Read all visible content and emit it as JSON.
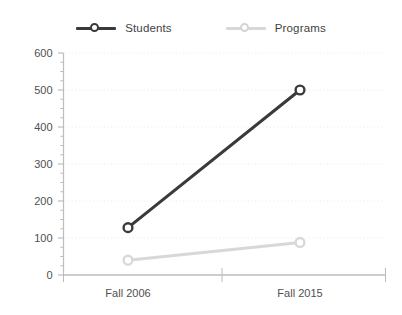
{
  "chart_data": {
    "type": "line",
    "title": "",
    "subtitle": "",
    "xlabel": "",
    "ylabel": "",
    "categories": [
      "Fall 2006",
      "Fall 2015"
    ],
    "series": [
      {
        "name": "Students",
        "values": [
          128,
          500
        ],
        "color": "#3a3a3a",
        "marker": "circle-open"
      },
      {
        "name": "Programs",
        "values": [
          40,
          88
        ],
        "color": "#d8d8d8",
        "marker": "circle-open"
      }
    ],
    "ylim": [
      0,
      600
    ],
    "yticks": [
      0,
      100,
      200,
      300,
      400,
      500,
      600
    ],
    "ytick_labels": [
      "0",
      "100",
      "200",
      "300",
      "400",
      "500",
      "600"
    ],
    "y_minor_tick_step": 25,
    "xtick_labels": [
      "Fall 2006",
      "Fall 2015"
    ],
    "grid": {
      "horizontal": true,
      "vertical": false,
      "style": "dotted",
      "color": "#e9e9e9"
    },
    "legend": {
      "position": "top",
      "entries": [
        "Students",
        "Programs"
      ]
    },
    "axis_color": "#bdbdbd",
    "background": "#ffffff"
  },
  "legend": {
    "entries": [
      {
        "label": "Students",
        "color": "#3a3a3a",
        "marker_border": "#3a3a3a"
      },
      {
        "label": "Programs",
        "color": "#d8d8d8",
        "marker_border": "#d4d4d4"
      }
    ]
  }
}
